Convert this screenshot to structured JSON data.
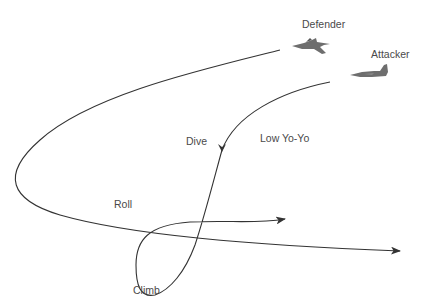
{
  "diagram": {
    "labels": {
      "defender": "Defender",
      "attacker": "Attacker",
      "dive": "Dive",
      "low_yo_yo": "Low Yo-Yo",
      "roll": "Roll",
      "climb": "Climb"
    },
    "icons": {
      "defender": "fighter-jet-icon",
      "attacker": "fighter-jet-icon"
    },
    "colors": {
      "line": "#333333",
      "text": "#4a4a4a",
      "jet": "#6e6e6e"
    }
  }
}
